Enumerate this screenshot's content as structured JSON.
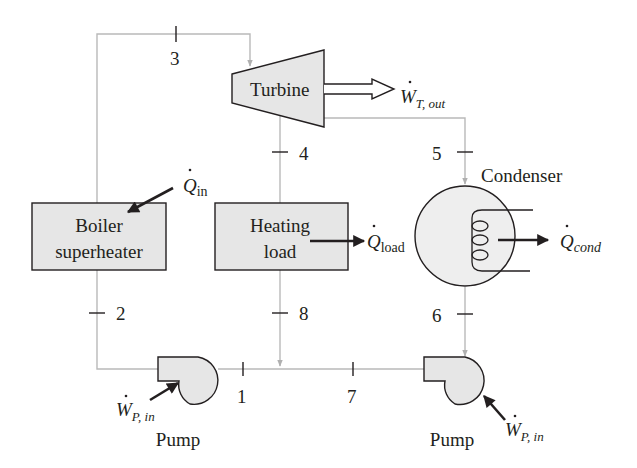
{
  "diagram": {
    "type": "steam power cycle with process heating (cogeneration)",
    "components": {
      "turbine": {
        "label": "Turbine"
      },
      "boiler": {
        "label_line1": "Boiler",
        "label_line2": "superheater"
      },
      "heating_load": {
        "label_line1": "Heating",
        "label_line2": "load"
      },
      "condenser": {
        "label": "Condenser"
      },
      "pump_left": {
        "label": "Pump"
      },
      "pump_right": {
        "label": "Pump"
      }
    },
    "energy_flows": {
      "turbine_work": {
        "symbol": "W",
        "subscript": "T, out"
      },
      "heat_in": {
        "symbol": "Q",
        "subscript": "in"
      },
      "heat_load": {
        "symbol": "Q",
        "subscript": "load"
      },
      "heat_cond": {
        "symbol": "Q",
        "subscript": "cond"
      },
      "pump_work_left": {
        "symbol": "W",
        "subscript": "P, in"
      },
      "pump_work_right": {
        "symbol": "W",
        "subscript": "P, in"
      }
    },
    "states": {
      "s1": "1",
      "s2": "2",
      "s3": "3",
      "s4": "4",
      "s5": "5",
      "s6": "6",
      "s7": "7",
      "s8": "8"
    },
    "colors": {
      "pipe": "#b9b9b9",
      "component_fill": "#e6e6e6",
      "outline": "#231f20"
    }
  }
}
